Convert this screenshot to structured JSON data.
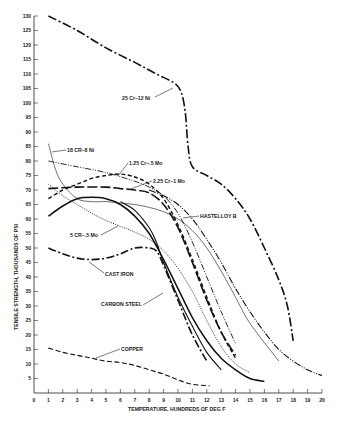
{
  "chart_data": {
    "type": "line",
    "title": "",
    "xlabel": "TEMPERATURE, HUNDREDS OF DEG F",
    "ylabel": "TENSILE STRENGTH, THOUSANDS OF PSI",
    "xlim": [
      0,
      20
    ],
    "ylim": [
      0,
      130
    ],
    "x_ticks": [
      0,
      1,
      2,
      3,
      4,
      5,
      6,
      7,
      8,
      9,
      10,
      11,
      12,
      13,
      14,
      15,
      16,
      17,
      18,
      19,
      20
    ],
    "y_ticks": [
      5,
      10,
      15,
      20,
      25,
      30,
      35,
      40,
      45,
      50,
      55,
      60,
      65,
      70,
      75,
      80,
      85,
      90,
      95,
      100,
      105,
      110,
      115,
      120,
      125,
      130
    ],
    "grid": false,
    "legend": "inline labels with leader arrows",
    "series": [
      {
        "name": "25 Cr–12 Ni",
        "style": "dash-dot-heavy",
        "x": [
          1,
          3,
          5,
          7,
          8.5,
          9.7,
          10.2,
          10.5,
          10.7,
          11,
          12,
          13,
          14,
          15,
          16,
          17,
          17.6,
          18
        ],
        "y": [
          130,
          125,
          119,
          114,
          110,
          107,
          104,
          97,
          85,
          78,
          75,
          72,
          67,
          60,
          50,
          39,
          30,
          18
        ]
      },
      {
        "name": "18 CR–8 Ni",
        "style": "thin-solid",
        "x": [
          1,
          1.5,
          2,
          3,
          4,
          5,
          6,
          7,
          8,
          9,
          10,
          11,
          12,
          13,
          14,
          15,
          17
        ],
        "y": [
          86,
          77,
          72,
          67,
          66,
          66,
          65.5,
          65,
          64,
          62.5,
          60,
          56,
          50,
          42,
          33,
          24,
          11
        ]
      },
      {
        "name": "unlabeled (dash-dot-dot)",
        "style": "dash-dot-thin",
        "x": [
          1,
          3,
          5,
          7,
          8,
          9,
          10,
          11,
          12,
          13,
          14
        ],
        "y": [
          80,
          78,
          76,
          73,
          71,
          68,
          62,
          52,
          40,
          28,
          17
        ]
      },
      {
        "name": "1.25 Cr–.5 Mo",
        "style": "short-dash",
        "x": [
          1,
          2,
          3,
          4,
          5,
          6,
          7,
          8,
          9,
          10,
          11,
          12,
          13,
          14
        ],
        "y": [
          67,
          70,
          72,
          74,
          75,
          75.5,
          74.5,
          72,
          67,
          58,
          46,
          33,
          21,
          12
        ]
      },
      {
        "name": "2.25 Cr–1 Mo",
        "style": "long-dash",
        "x": [
          1,
          3,
          5,
          6,
          7,
          8,
          9,
          10,
          11,
          12,
          13,
          14
        ],
        "y": [
          70.5,
          71,
          71,
          70.5,
          70,
          69,
          65,
          57,
          45,
          32,
          21,
          13
        ]
      },
      {
        "name": "HASTELLOY B",
        "style": "heavy-dotted-dash",
        "x": [
          8,
          9,
          10,
          11,
          12,
          13,
          14,
          15,
          16,
          17,
          18,
          19,
          20
        ],
        "y": [
          70,
          68,
          65,
          60,
          53,
          45,
          36,
          28,
          21,
          15,
          11,
          8,
          6
        ]
      },
      {
        "name": "5 CR–.5 Mo",
        "style": "dotted",
        "x": [
          1,
          2,
          3,
          4,
          5,
          6,
          7,
          8,
          9,
          10,
          11,
          12,
          13,
          14,
          15
        ],
        "y": [
          72,
          68,
          65,
          62,
          59.5,
          57.5,
          55.5,
          53,
          49,
          43,
          35,
          25,
          16,
          10,
          7
        ]
      },
      {
        "name": "unlabeled (heavy solid)",
        "style": "heavy-solid",
        "x": [
          1,
          2,
          3,
          4,
          5,
          6,
          7,
          8,
          9,
          10,
          11,
          12,
          13,
          14,
          15,
          16
        ],
        "y": [
          61,
          64.5,
          67,
          67.5,
          67,
          65,
          61,
          55,
          46,
          36,
          26,
          18,
          12,
          8,
          5,
          4
        ]
      },
      {
        "name": "CAST IRON",
        "style": "heavy-long-dash-dot",
        "x": [
          1,
          2,
          3,
          4,
          5,
          6,
          7,
          8,
          8.5,
          9,
          10,
          11,
          12
        ],
        "y": [
          50,
          48,
          46.5,
          46,
          46.5,
          48,
          50,
          50,
          49,
          44,
          32,
          20,
          11
        ]
      },
      {
        "name": "CARBON STEEL",
        "style": "solid",
        "x": [
          6,
          7,
          8,
          8.5,
          9,
          10,
          11,
          12,
          13
        ],
        "y": [
          66,
          63,
          57,
          52,
          45,
          33,
          23,
          14,
          8
        ]
      },
      {
        "name": "COPPER",
        "style": "dashed",
        "x": [
          1,
          2,
          3,
          4,
          5,
          6,
          7,
          8,
          9,
          10,
          11,
          12.2
        ],
        "y": [
          15.5,
          14,
          13,
          12,
          11,
          10.5,
          9.5,
          8,
          6.5,
          4.5,
          3,
          2.5
        ]
      }
    ]
  }
}
